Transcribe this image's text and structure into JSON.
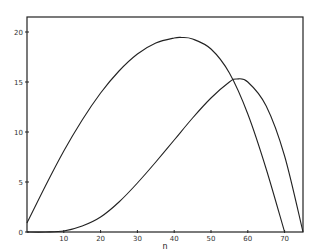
{
  "chart_data": {
    "type": "line",
    "title": "",
    "xlabel": "n",
    "ylabel": "",
    "xlim": [
      0,
      75
    ],
    "ylim": [
      0,
      21.5
    ],
    "grid": false,
    "legend": null,
    "xticks": [
      10,
      20,
      30,
      40,
      50,
      60,
      70
    ],
    "xtick_labels": [
      "10",
      "20",
      "30",
      "40",
      "50",
      "60",
      "70"
    ],
    "yticks": [
      0,
      5,
      10,
      15,
      20
    ],
    "ytick_labels": [
      "0",
      "5",
      "10",
      "15",
      "20"
    ],
    "series": [
      {
        "name": "curve-1",
        "color": "#222222",
        "x": [
          0,
          5,
          10,
          15,
          20,
          25,
          30,
          35,
          40,
          42,
          45,
          50,
          55,
          60,
          65,
          70
        ],
        "y": [
          0.9,
          4.6,
          8.1,
          11.2,
          13.9,
          16.1,
          17.8,
          18.9,
          19.4,
          19.45,
          19.3,
          18.3,
          15.9,
          11.8,
          6.3,
          0
        ]
      },
      {
        "name": "curve-2",
        "color": "#222222",
        "x": [
          0,
          5,
          10,
          15,
          20,
          25,
          30,
          35,
          40,
          45,
          50,
          55,
          57,
          60,
          65,
          70,
          75
        ],
        "y": [
          0,
          0,
          0.1,
          0.6,
          1.5,
          3.0,
          4.9,
          7.0,
          9.2,
          11.4,
          13.4,
          15.0,
          15.3,
          15.0,
          12.6,
          7.6,
          0
        ]
      }
    ]
  },
  "plot": {
    "frame": {
      "left": 27,
      "top": 17,
      "right": 303,
      "bottom": 232
    }
  }
}
